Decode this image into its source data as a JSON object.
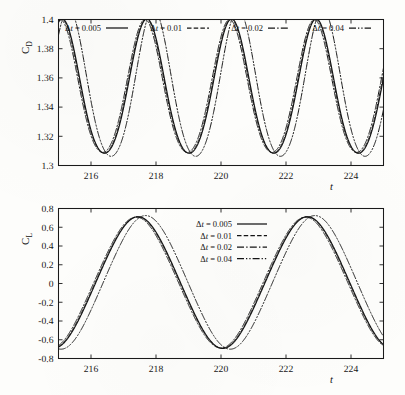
{
  "figure": {
    "background_color": "#fdfdfb",
    "ink_color": "#141414"
  },
  "panels": {
    "drag": {
      "name": "C_D time history",
      "ylabel_main": "C",
      "ylabel_sub": "D",
      "xlabel": "t",
      "legend_orientation": "horizontal",
      "legend_position": "top-inside"
    },
    "lift": {
      "name": "C_L time history",
      "ylabel_main": "C",
      "ylabel_sub": "L",
      "xlabel": "t",
      "legend_orientation": "vertical",
      "legend_position": "top-center-inside"
    }
  },
  "legend_entries": [
    {
      "label": "Δt = 0.005",
      "prefix": "Δ",
      "ital": "t",
      "rest": " = 0.005",
      "style": "solid",
      "dash": "none"
    },
    {
      "label": "Δt = 0.01",
      "prefix": "Δ",
      "ital": "t",
      "rest": " = 0.01",
      "style": "dashed",
      "dash": "4.5,2.2"
    },
    {
      "label": "Δt = 0.02",
      "prefix": "Δ",
      "ital": "t",
      "rest": " = 0.02",
      "style": "dash-dot",
      "dash": "7,2.2,1.4,2.2"
    },
    {
      "label": "Δt = 0.04",
      "prefix": "Δ",
      "ital": "t",
      "rest": " = 0.04",
      "style": "dash-dot-dot",
      "dash": "7,2,1.3,2,1.3,2"
    }
  ],
  "chart_data": [
    {
      "type": "line",
      "id": "cd-panel",
      "title": "",
      "xlabel": "t",
      "ylabel": "C_D",
      "xlim": [
        215.0,
        225.0
      ],
      "ylim": [
        1.3,
        1.4
      ],
      "xticks": [
        216,
        218,
        220,
        222,
        224
      ],
      "xticklabels": [
        "216",
        "218",
        "220",
        "222",
        "224"
      ],
      "yticks": [
        1.3,
        1.32,
        1.34,
        1.36,
        1.38,
        1.4
      ],
      "yticklabels": [
        "1.3",
        "1.32",
        "1.34",
        "1.36",
        "1.38",
        "1.4"
      ],
      "grid": false,
      "legend_position": "upper inside horizontal",
      "series": [
        {
          "name": "Δt = 0.005",
          "style": "solid",
          "mean": 1.3505,
          "amplitude": 0.046,
          "period": 2.605,
          "phase_peak_t": 217.72,
          "peak_value": 1.3965,
          "trough_value": 1.3045
        },
        {
          "name": "Δt = 0.01",
          "style": "dashed",
          "mean": 1.3505,
          "amplitude": 0.0458,
          "period": 2.605,
          "phase_peak_t": 217.7,
          "peak_value": 1.3963,
          "trough_value": 1.3047
        },
        {
          "name": "Δt = 0.02",
          "style": "dash-dot",
          "mean": 1.3506,
          "amplitude": 0.0455,
          "period": 2.605,
          "phase_peak_t": 217.66,
          "peak_value": 1.3961,
          "trough_value": 1.3051
        },
        {
          "name": "Δt = 0.04",
          "style": "dash-dot-dot",
          "mean": 1.3525,
          "amplitude": 0.0505,
          "period": 2.605,
          "phase_peak_t": 217.92,
          "peak_value": 1.403,
          "trough_value": 1.3075
        }
      ]
    },
    {
      "type": "line",
      "id": "cl-panel",
      "title": "",
      "xlabel": "t",
      "ylabel": "C_L",
      "xlim": [
        215.0,
        225.0
      ],
      "ylim": [
        -0.8,
        0.8
      ],
      "xticks": [
        216,
        218,
        220,
        222,
        224
      ],
      "xticklabels": [
        "216",
        "218",
        "220",
        "222",
        "224"
      ],
      "yticks": [
        -0.8,
        -0.6,
        -0.4,
        -0.2,
        0,
        0.2,
        0.4,
        0.6,
        0.8
      ],
      "yticklabels": [
        "-0.8",
        "-0.6",
        "-0.4",
        "-0.2",
        "0",
        "0.2",
        "0.4",
        "0.6",
        "0.8"
      ],
      "grid": false,
      "legend_position": "upper center inside vertical",
      "series": [
        {
          "name": "Δt = 0.005",
          "style": "solid",
          "mean": 0.01,
          "amplitude": 0.69,
          "period": 5.21,
          "phase_peak_t": 217.45,
          "peak_value": 0.7,
          "trough_value": -0.68
        },
        {
          "name": "Δt = 0.01",
          "style": "dashed",
          "mean": 0.01,
          "amplitude": 0.688,
          "period": 5.21,
          "phase_peak_t": 217.43,
          "peak_value": 0.698,
          "trough_value": -0.678
        },
        {
          "name": "Δt = 0.02",
          "style": "dash-dot",
          "mean": 0.01,
          "amplitude": 0.686,
          "period": 5.21,
          "phase_peak_t": 217.39,
          "peak_value": 0.696,
          "trough_value": -0.676
        },
        {
          "name": "Δt = 0.04",
          "style": "dash-dot-dot",
          "mean": 0.012,
          "amplitude": 0.7,
          "period": 5.21,
          "phase_peak_t": 217.68,
          "peak_value": 0.712,
          "trough_value": -0.688
        }
      ]
    }
  ]
}
